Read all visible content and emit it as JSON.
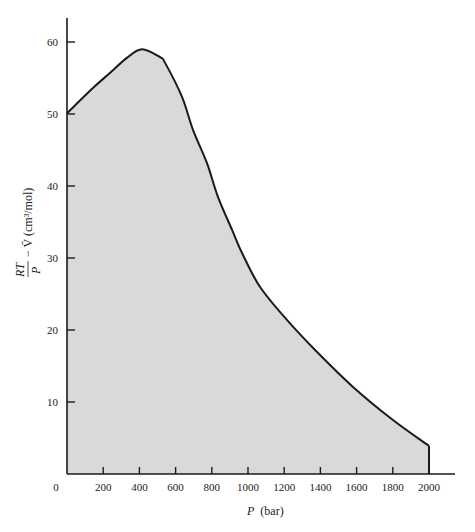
{
  "chart_data": {
    "type": "area",
    "title": "",
    "xlabel": "P (bar)",
    "xlabel_italic_part": "P",
    "xlabel_unit": "(bar)",
    "ylabel": "RT/P − V̄ (cm³/mol)",
    "ylabel_parts": {
      "numerator": "RT",
      "denominator": "P",
      "rest": "− V̄ (cm³/mol)"
    },
    "xlim": [
      0,
      2000
    ],
    "ylim": [
      0,
      63
    ],
    "x_ticks": [
      0,
      200,
      400,
      600,
      800,
      1000,
      1200,
      1400,
      1600,
      1800,
      2000
    ],
    "y_ticks": [
      10,
      20,
      30,
      40,
      50,
      60
    ],
    "grid": false,
    "legend": null,
    "fill_color": "#d9d9d9",
    "line_color": "#1a1a1a",
    "series": [
      {
        "name": "RT/P - V",
        "x": [
          0,
          143,
          237,
          331,
          414,
          514,
          542,
          635,
          696,
          773,
          834,
          912,
          967,
          1066,
          1215,
          1387,
          1580,
          1801,
          2000
        ],
        "values": [
          50.1,
          53.6,
          55.7,
          57.8,
          59.0,
          57.9,
          57.1,
          52.4,
          47.8,
          43.2,
          38.5,
          33.9,
          30.7,
          26.0,
          21.4,
          16.8,
          12.1,
          7.5,
          3.9
        ]
      }
    ]
  }
}
